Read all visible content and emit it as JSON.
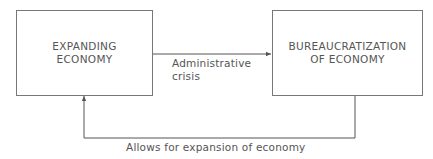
{
  "diagram": {
    "nodes": [
      {
        "id": "expanding-economy",
        "label_line1": "EXPANDING",
        "label_line2": "ECONOMY"
      },
      {
        "id": "bureaucratization",
        "label_line1": "BUREAUCRATIZATION",
        "label_line2": "OF ECONOMY"
      }
    ],
    "edges": [
      {
        "from": "expanding-economy",
        "to": "bureaucratization",
        "label_line1": "Administrative",
        "label_line2": "crisis"
      },
      {
        "from": "bureaucratization",
        "to": "expanding-economy",
        "label": "Allows for expansion of economy"
      }
    ]
  }
}
